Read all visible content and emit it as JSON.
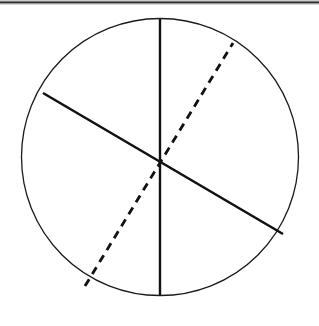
{
  "figure": {
    "caption": "",
    "background_color": "#ffffff",
    "canvas": {
      "width": 319,
      "height": 326
    },
    "top_rule": {
      "name": "top-border-rule",
      "color": "#2b2b2b",
      "secondary_color": "#9a9a9a",
      "y": 2,
      "thickness": 2,
      "x_start": 0,
      "x_end": 319
    },
    "circle": {
      "name": "circle-outline",
      "center_x": 160,
      "center_y": 157,
      "radius": 138,
      "stroke_color": "#1a1a1a",
      "stroke_width": 1.3,
      "fill": "none"
    },
    "diameters": [
      {
        "id": "vertical-diameter",
        "style": "solid",
        "label": "vertical diameter",
        "x1": 160,
        "y1": 19,
        "x2": 160,
        "y2": 295,
        "stroke_color": "#111111",
        "stroke_width": 2.4,
        "angle_deg": 90
      },
      {
        "id": "solid-diagonal-diameter",
        "style": "solid",
        "label": "solid slanted diameter",
        "x1": 43,
        "y1": 93,
        "x2": 283,
        "y2": 234,
        "stroke_color": "#111111",
        "stroke_width": 2.6,
        "angle_deg": -30
      },
      {
        "id": "dashed-diagonal-diameter",
        "style": "dashed",
        "label": "dashed slanted diameter",
        "x1": 85,
        "y1": 286,
        "x2": 233,
        "y2": 43,
        "stroke_color": "#111111",
        "stroke_width": 2.8,
        "dash_length": 8,
        "dash_gap": 6,
        "angle_deg": 58
      }
    ],
    "sector_count": 6,
    "alt_text": "A circle crossed by three diameters through its centre: one vertical solid line, one solid line slanting from upper left to lower right, and one dashed line slanting from lower left to upper right, dividing the circle into six sectors."
  }
}
